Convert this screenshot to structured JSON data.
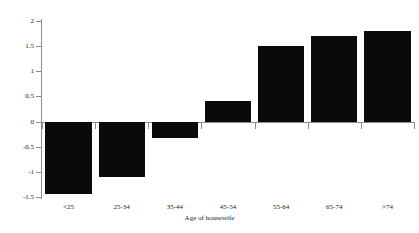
{
  "chart_data": {
    "type": "bar",
    "title": "",
    "subtitle": "",
    "xlabel": "Age of housewife",
    "ylabel": "",
    "categories": [
      "<25",
      "25-34",
      "35-44",
      "45-54",
      "55-64",
      "65-74",
      ">74"
    ],
    "values": [
      -1.45,
      -1.1,
      -0.32,
      0.4,
      1.5,
      1.7,
      1.8
    ],
    "series": [
      {
        "name": "",
        "values": [
          -1.45,
          -1.1,
          -0.32,
          0.4,
          1.5,
          1.7,
          1.8
        ]
      }
    ],
    "ylim": [
      -1.5,
      2
    ],
    "yticks": [
      -1.5,
      -1,
      -0.5,
      0,
      0.5,
      1,
      1.5,
      2
    ],
    "ytick_labels": [
      "-1.5",
      "-1",
      "-0.5",
      "0",
      "0.5",
      "1",
      "1.5",
      "2"
    ],
    "grid": false,
    "legend": false,
    "legend_position": "none",
    "bar_color": "#0a0a0a",
    "axis_color": "#8d8d8d",
    "background_color": "#ffffff",
    "annotations": []
  }
}
